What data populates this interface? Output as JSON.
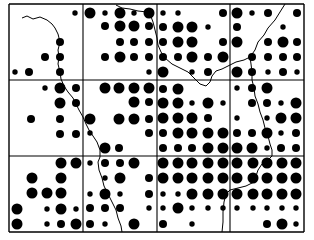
{
  "map": {
    "type": "proportional-dot-grid-map",
    "background": "#ffffff",
    "ink": "#000000",
    "grid": {
      "x_lines": [
        9,
        83,
        157,
        230,
        304
      ],
      "y_lines": [
        4,
        80,
        156,
        232
      ],
      "rows": 3,
      "cols": 4
    },
    "size_radius": {
      "S": 2.7,
      "M": 4.0,
      "L": 5.5
    },
    "cells": [
      {
        "row": 0,
        "col": 0,
        "xs": [
          15,
          29,
          45,
          60,
          75
        ],
        "ys": [
          13,
          27,
          42,
          57,
          72
        ],
        "dots": [
          "----S",
          "-----",
          "---M-",
          "--MM-",
          "SM-M-"
        ]
      },
      {
        "row": 0,
        "col": 1,
        "xs": [
          90,
          105,
          120,
          134,
          149
        ],
        "ys": [
          13,
          26,
          42,
          57,
          72
        ],
        "dots": [
          "LSLSL",
          "-MLLM",
          "--MMM",
          "-MLMM",
          "----S"
        ]
      },
      {
        "row": 0,
        "col": 2,
        "xs": [
          163,
          178,
          192,
          208,
          223
        ],
        "ys": [
          13,
          27,
          42,
          57,
          72
        ],
        "dots": [
          "SS--M",
          "MLLS-",
          "MLL-M",
          "MMLML",
          "L-SM-"
        ]
      },
      {
        "row": 0,
        "col": 3,
        "xs": [
          237,
          252,
          268,
          283,
          297
        ],
        "ys": [
          13,
          27,
          42,
          57,
          72
        ],
        "dots": [
          "LSM-M",
          "M--S-",
          "L-MLM",
          "-MMMM",
          "LMSMS"
        ]
      },
      {
        "row": 1,
        "col": 0,
        "xs": [
          17,
          31,
          45,
          60,
          76
        ],
        "ys": [
          88,
          103,
          119,
          134,
          149
        ],
        "dots": [
          "--SLM",
          "---LM",
          "-M-M-",
          "---MM",
          "-----"
        ]
      },
      {
        "row": 1,
        "col": 1,
        "xs": [
          90,
          105,
          119,
          134,
          149
        ],
        "ys": [
          88,
          102,
          119,
          133,
          148
        ],
        "dots": [
          "-LLLL",
          "---LM",
          "L-LLM",
          "S---M",
          "-LM--"
        ]
      },
      {
        "row": 1,
        "col": 2,
        "xs": [
          163,
          178,
          192,
          208,
          223
        ],
        "ys": [
          89,
          103,
          118,
          133,
          148
        ],
        "dots": [
          "ML---",
          "LLSLS",
          "LLLM-",
          "MLLLL",
          "MMMLL"
        ]
      },
      {
        "row": 1,
        "col": 3,
        "xs": [
          237,
          252,
          267,
          281,
          296
        ],
        "ys": [
          88,
          103,
          118,
          133,
          148
        ],
        "dots": [
          "SML--",
          "-MMSL",
          "S-SLL",
          "MMLSM",
          "LLSMM"
        ]
      },
      {
        "row": 2,
        "col": 0,
        "xs": [
          17,
          32,
          47,
          61,
          76
        ],
        "ys": [
          163,
          178,
          193,
          209,
          224
        ],
        "dots": [
          "---LL",
          "-L-L-",
          "-LLL-",
          "L-SLS",
          "L-SML"
        ]
      },
      {
        "row": 2,
        "col": 1,
        "xs": [
          90,
          105,
          120,
          134,
          149
        ],
        "ys": [
          163,
          178,
          194,
          208,
          224
        ],
        "dots": [
          "SMML-",
          "-SL-M",
          "SLS-M",
          "MMM-S",
          "MS-L-"
        ]
      },
      {
        "row": 2,
        "col": 2,
        "xs": [
          163,
          178,
          192,
          208,
          223
        ],
        "ys": [
          163,
          178,
          194,
          208,
          224
        ],
        "dots": [
          "LLLLL",
          "LLLLL",
          "SSLLL",
          "SLSSS",
          "M-S--"
        ]
      },
      {
        "row": 2,
        "col": 3,
        "xs": [
          237,
          253,
          267,
          282,
          296
        ],
        "ys": [
          163,
          178,
          194,
          208,
          224
        ],
        "dots": [
          "LLLLL",
          "LLLLL",
          "LLLLL",
          "SSSSS",
          "--MLS"
        ]
      }
    ],
    "boundaries": [
      {
        "name": "western-river",
        "points": "22,18 27,16 33,19 40,17 47,20 52,24 55,28 58,34 60,42 58,50 59,57 58,64 60,72 61,79 64,86 68,92 73,98 76,104 79,110 83,117 86,124 89,130 93,136 97,142 100,150 100,157 98,162 99,170 102,178 104,186 108,194 112,202 116,210 118,218 121,226 122,232"
      },
      {
        "name": "northern-river",
        "points": "116,5 122,8 130,9 138,11 147,12 150,14 153,22 155,30 157,38 158,45 161,52 165,58 172,64 180,68 188,72 194,78 200,84 206,86 210,82 212,76 216,71 222,69 230,65 236,62 244,60 250,57 255,50 258,42 264,35 268,28 275,20 280,12 285,4"
      },
      {
        "name": "eastern-river",
        "points": "250,57 251,64 252,72 252,80 254,88 255,96 258,104 260,112 263,120 265,128 268,136 270,144 272,150 272,156 268,160 262,164 258,170 256,176 254,182 246,186 238,188 230,190 226,194 224,202 223,212 223,222 222,232"
      }
    ]
  }
}
